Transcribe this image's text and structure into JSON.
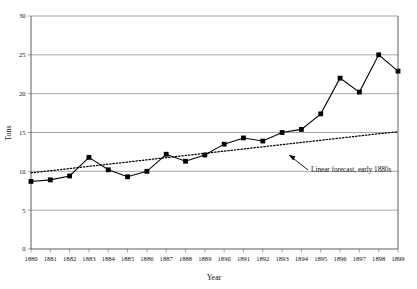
{
  "chart_data": {
    "type": "line",
    "title": "",
    "xlabel": "Year",
    "ylabel": "Tons",
    "xlim": [
      1880,
      1899
    ],
    "ylim": [
      0,
      30
    ],
    "ytick_step": 5,
    "grid": true,
    "legend": "none",
    "x": [
      1880,
      1881,
      1882,
      1883,
      1884,
      1885,
      1886,
      1887,
      1888,
      1889,
      1890,
      1891,
      1892,
      1893,
      1894,
      1895,
      1896,
      1897,
      1898,
      1899
    ],
    "xtick_labels": [
      "1880",
      "1881",
      "1882",
      "1883",
      "1884",
      "1885",
      "1886",
      "1887",
      "1888",
      "1889",
      "1890",
      "1891",
      "1892",
      "1893",
      "1894",
      "1895",
      "1896",
      "1897",
      "1898",
      "1899"
    ],
    "ytick_labels": [
      "0",
      "5",
      "10",
      "15",
      "20",
      "25",
      "30"
    ],
    "ytick_values": [
      0,
      5,
      10,
      15,
      20,
      25,
      30
    ],
    "series": [
      {
        "name": "Tons",
        "style": "solid-with-square-markers",
        "color": "#000000",
        "values": [
          8.7,
          8.9,
          9.4,
          11.8,
          10.2,
          9.3,
          10.0,
          12.2,
          11.3,
          12.1,
          13.5,
          14.3,
          13.9,
          15.0,
          15.4,
          17.4,
          22.0,
          20.2,
          25.0,
          22.9
        ]
      },
      {
        "name": "Linear forecast, early 1880s",
        "style": "dotted",
        "color": "#000000",
        "values": [
          9.8,
          10.08,
          10.36,
          10.64,
          10.92,
          11.2,
          11.48,
          11.76,
          12.04,
          12.32,
          12.6,
          12.88,
          13.16,
          13.44,
          13.72,
          14.0,
          14.28,
          14.56,
          14.84,
          15.1
        ]
      }
    ],
    "annotations": [
      {
        "text": "Linear forecast, early 1880s",
        "points_to_year": 1894,
        "points_to_value": 13.6
      }
    ]
  }
}
